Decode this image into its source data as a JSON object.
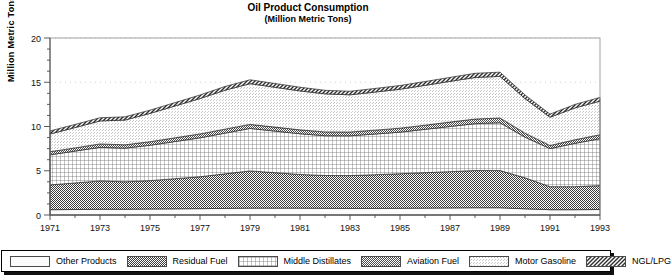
{
  "title": {
    "main": "Oil Product Consumption",
    "sub": "(Million Metric Tons)"
  },
  "axes": {
    "ylabel": "Million Metric Tons",
    "yticks": [
      "0",
      "5",
      "10",
      "15",
      "20"
    ],
    "xticks": [
      "1971",
      "1973",
      "1975",
      "1977",
      "1979",
      "1981",
      "1983",
      "1985",
      "1987",
      "1989",
      "1991",
      "1993"
    ]
  },
  "legend": {
    "items": [
      {
        "label": "Other Products",
        "pattern": "blank",
        "color": "#ffffff"
      },
      {
        "label": "Residual Fuel",
        "pattern": "checker",
        "color": "#555555"
      },
      {
        "label": "Middle Distillates",
        "pattern": "grid",
        "color": "#9a9a9a"
      },
      {
        "label": "Aviation Fuel",
        "pattern": "checker2",
        "color": "#5c5c5c"
      },
      {
        "label": "Motor Gasoline",
        "pattern": "stipple",
        "color": "#e0e0e0"
      },
      {
        "label": "NGL/LPG",
        "pattern": "diagonal",
        "color": "#4a4a4a"
      }
    ]
  },
  "chart_data": {
    "type": "area",
    "stacked": true,
    "title": "Oil Product Consumption",
    "subtitle": "(Million Metric Tons)",
    "xlabel": "",
    "ylabel": "Million Metric Tons",
    "ylim": [
      0,
      20
    ],
    "xlim": [
      1971,
      1993
    ],
    "grid": true,
    "legend_position": "bottom",
    "x": [
      1971,
      1972,
      1973,
      1974,
      1975,
      1976,
      1977,
      1978,
      1979,
      1980,
      1981,
      1982,
      1983,
      1984,
      1985,
      1986,
      1987,
      1988,
      1989,
      1990,
      1991,
      1992,
      1993
    ],
    "series": [
      {
        "name": "Other Products",
        "values": [
          0.6,
          0.62,
          0.65,
          0.65,
          0.68,
          0.7,
          0.72,
          0.75,
          0.78,
          0.78,
          0.78,
          0.76,
          0.75,
          0.75,
          0.76,
          0.78,
          0.8,
          0.82,
          0.82,
          0.7,
          0.6,
          0.6,
          0.62
        ]
      },
      {
        "name": "Residual Fuel",
        "values": [
          2.8,
          3.0,
          3.2,
          3.1,
          3.2,
          3.4,
          3.6,
          3.9,
          4.2,
          4.0,
          3.8,
          3.7,
          3.7,
          3.8,
          3.9,
          4.0,
          4.1,
          4.2,
          4.2,
          3.5,
          2.6,
          2.6,
          2.7
        ]
      },
      {
        "name": "Middle Distillates",
        "values": [
          3.4,
          3.6,
          3.8,
          3.8,
          4.0,
          4.2,
          4.4,
          4.6,
          4.8,
          4.7,
          4.6,
          4.5,
          4.5,
          4.6,
          4.7,
          4.9,
          5.1,
          5.3,
          5.4,
          4.6,
          4.3,
          4.9,
          5.3
        ]
      },
      {
        "name": "Aviation Fuel",
        "values": [
          0.35,
          0.36,
          0.38,
          0.38,
          0.4,
          0.42,
          0.44,
          0.45,
          0.46,
          0.45,
          0.44,
          0.43,
          0.43,
          0.44,
          0.45,
          0.47,
          0.5,
          0.52,
          0.54,
          0.45,
          0.35,
          0.4,
          0.45
        ]
      },
      {
        "name": "Motor Gasoline",
        "values": [
          2.0,
          2.3,
          2.6,
          2.8,
          3.2,
          3.6,
          4.0,
          4.4,
          4.6,
          4.5,
          4.4,
          4.3,
          4.2,
          4.3,
          4.4,
          4.5,
          4.6,
          4.7,
          4.7,
          3.9,
          3.2,
          3.6,
          3.8
        ]
      },
      {
        "name": "NGL/LPG",
        "values": [
          0.35,
          0.35,
          0.36,
          0.36,
          0.37,
          0.38,
          0.4,
          0.42,
          0.44,
          0.43,
          0.42,
          0.4,
          0.4,
          0.41,
          0.42,
          0.43,
          0.45,
          0.47,
          0.48,
          0.42,
          0.35,
          0.4,
          0.42
        ]
      }
    ],
    "totals": [
      9.5,
      10.23,
      10.99,
      11.09,
      11.85,
      12.7,
      13.56,
      14.52,
      15.28,
      14.86,
      14.44,
      14.09,
      13.98,
      14.3,
      14.63,
      15.08,
      15.55,
      16.01,
      16.14,
      13.57,
      11.4,
      12.5,
      13.29
    ]
  }
}
